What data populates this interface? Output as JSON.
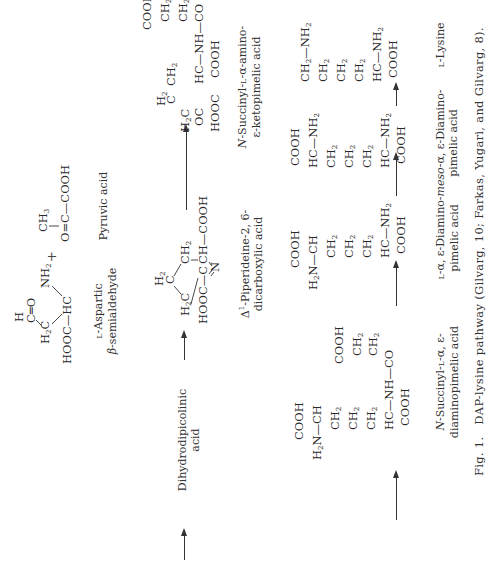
{
  "figure": {
    "caption_number": "Fig. 1.",
    "caption_text": "DAP-lysine pathway (Gilvarg, 10; Farkas, Yugari, and Gilvarg, 8).",
    "orientation": "rotated 90° counter-clockwise"
  },
  "compounds": [
    {
      "id": "aspartic-semialdehyde",
      "name_line1": "L-Aspartic",
      "name_line2": "β-semialdehyde",
      "formula": {
        "cho_h": "H",
        "cho": "C=O",
        "ch2": "H2C",
        "hc": "HC",
        "nh2": "NH2",
        "hooc": "HOOC"
      }
    },
    {
      "id": "pyruvic-acid",
      "name": "Pyruvic acid",
      "formula": {
        "ch3": "CH3",
        "main": "O=C—COOH"
      }
    },
    {
      "id": "dihydrodipicolinic-acid",
      "name_line1": "Dihydrodipicolinic",
      "name_line2": "acid"
    },
    {
      "id": "piperideine-dicarboxylic-acid",
      "name_line1": "Δ1-Piperideine-2, 6-",
      "name_line2": "dicarboxylic acid",
      "formula": {
        "h2c_top": "H2",
        "c_top": "C",
        "h2c": "H2C",
        "ch2": "CH2",
        "cooh_right": "CH—COOH",
        "hooc": "HOOC—C",
        "n": "N"
      }
    },
    {
      "id": "succinyl-ketopimelic-acid",
      "name_line1": "N-Succinyl-L-α-amino-",
      "name_line2": "ε-ketopimelic acid"
    },
    {
      "id": "succinyl-dap",
      "name_line1": "N-Succinyl-L-α, ε-",
      "name_line2": "diaminopimelic acid"
    },
    {
      "id": "ll-dap",
      "name_line1": "L-α, ε-Diamino-",
      "name_line2": "pimelic acid"
    },
    {
      "id": "meso-dap",
      "name_line1": "meso-α, ε-Diamino-",
      "name_line2": "pimelic acid"
    },
    {
      "id": "lysine",
      "name": "L-Lysine"
    }
  ],
  "symbols": {
    "plus": "+",
    "COOH": "COOH",
    "HOOC": "HOOC",
    "CH2": "CH2",
    "CH": "CH",
    "HC": "HC",
    "NH2": "NH2",
    "H2N": "H2N",
    "CO": "CO",
    "OC": "OC",
    "NH": "NH",
    "H2C": "H2C",
    "C": "C",
    "H2": "H2"
  }
}
